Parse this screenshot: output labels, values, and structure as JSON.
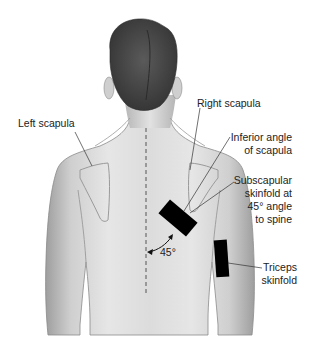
{
  "figure": {
    "labels": {
      "left_scapula": "Left scapula",
      "right_scapula": "Right scapula",
      "inferior_angle": [
        "Inferior angle",
        "of scapula"
      ],
      "subscapular": [
        "Subscapular",
        "skinfold at",
        "45° angle",
        "to spine"
      ],
      "triceps": [
        "Triceps",
        "skinfold"
      ],
      "angle": "45°"
    },
    "colors": {
      "background": "#ffffff",
      "skin_light": "#ececec",
      "skin_mid": "#d2d2d2",
      "skin_shadow": "#a8a8a8",
      "hair": "#4a4a4a",
      "marker": "#000000",
      "leader_line": "#333333",
      "text": "#222222"
    }
  }
}
